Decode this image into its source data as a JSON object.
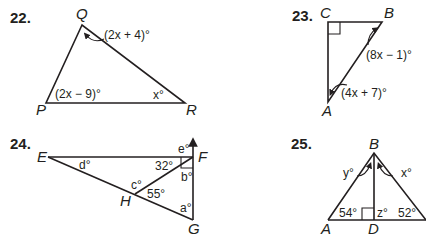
{
  "problems": [
    {
      "number": "22.",
      "vertices": {
        "Q": "Q",
        "P": "P",
        "R": "R"
      },
      "angles": {
        "Q": "(2x + 4)°",
        "P": "(2x − 9)°",
        "R": "x°"
      }
    },
    {
      "number": "23.",
      "vertices": {
        "C": "C",
        "B": "B",
        "A": "A"
      },
      "angles": {
        "C": "right angle",
        "B": "(8x −  1)°",
        "A": "(4x + 7)°"
      }
    },
    {
      "number": "24.",
      "vertices": {
        "E": "E",
        "F": "F",
        "G": "G",
        "H": "H"
      },
      "angles": {
        "d": "d°",
        "e": "e°",
        "b": "b°",
        "c": "c°",
        "a": "a°",
        "EFH": "32°",
        "FHG": "55°"
      }
    },
    {
      "number": "25.",
      "vertices": {
        "B": "B",
        "A": "A",
        "D": "D"
      },
      "angles": {
        "y": "y°",
        "x": "x°",
        "A": "54°",
        "z": "z°",
        "C": "52°"
      }
    }
  ],
  "colors": {
    "ink": "#231f20",
    "background": "#ffffff"
  }
}
